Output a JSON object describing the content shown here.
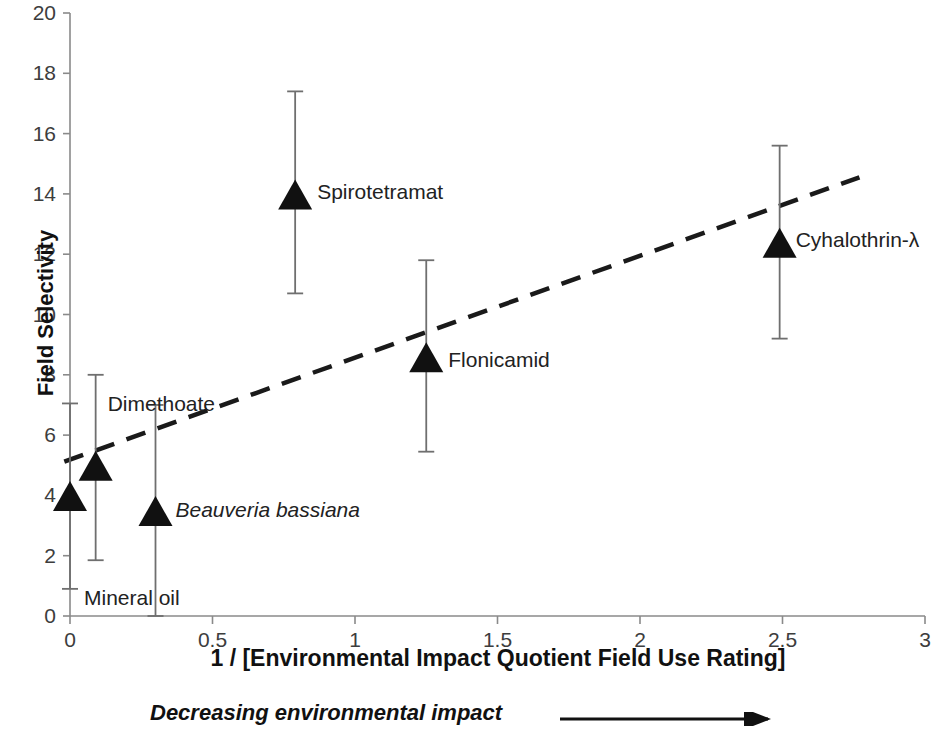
{
  "chart_data": {
    "type": "scatter",
    "title": "",
    "xlabel": "1 / [Environmental Impact Quotient Field Use Rating]",
    "ylabel": "Field Selectivity",
    "xlim": [
      0,
      3
    ],
    "ylim": [
      0,
      20
    ],
    "xticks": [
      "0",
      "0.5",
      "1",
      "1.5",
      "2",
      "2.5",
      "3"
    ],
    "xtick_values": [
      0,
      0.5,
      1,
      1.5,
      2,
      2.5,
      3
    ],
    "yticks": [
      "0",
      "2",
      "4",
      "6",
      "8",
      "10",
      "12",
      "14",
      "16",
      "18",
      "20"
    ],
    "ytick_values": [
      0,
      2,
      4,
      6,
      8,
      10,
      12,
      14,
      16,
      18,
      20
    ],
    "grid": false,
    "legend": "none",
    "marker": "filled-triangle",
    "error_bars": "vertical",
    "points": [
      {
        "label": "Mineral oil",
        "x": 0.0,
        "y": 4.0,
        "y_low": 0.9,
        "y_high": 7.05,
        "italic": false,
        "label_dx": 14,
        "label_dy": 103
      },
      {
        "label": "Dimethoate",
        "x": 0.09,
        "y": 5.0,
        "y_low": 1.85,
        "y_high": 8.0,
        "italic": false,
        "label_dx": 12,
        "label_dy": -61
      },
      {
        "label": "Beauveria bassiana",
        "x": 0.3,
        "y": 3.5,
        "y_low": 0.0,
        "y_high": 7.0,
        "italic": true,
        "label_dx": 20,
        "label_dy": 0
      },
      {
        "label": "Spirotetramat",
        "x": 0.79,
        "y": 14.0,
        "y_low": 10.7,
        "y_high": 17.4,
        "italic": false,
        "label_dx": 22,
        "label_dy": -2
      },
      {
        "label": "Flonicamid",
        "x": 1.25,
        "y": 8.6,
        "y_low": 5.45,
        "y_high": 11.8,
        "italic": false,
        "label_dx": 22,
        "label_dy": 3
      },
      {
        "label": "Cyhalothrin-λ",
        "x": 2.49,
        "y": 12.4,
        "y_low": 9.2,
        "y_high": 15.6,
        "italic": false,
        "label_dx": 16,
        "label_dy": -2
      }
    ],
    "trendline": {
      "style": "dashed",
      "x_start": -0.02,
      "y_start": 5.12,
      "x_end": 2.77,
      "y_end": 14.55
    },
    "annotation": {
      "text": "Decreasing environmental impact",
      "arrow": "right-arrow"
    },
    "colors": {
      "marker": "#111111",
      "error_bar": "#6f6f6f",
      "axis": "#8a8a8a",
      "trendline": "#1a1a1a",
      "text": "#222222",
      "background": "#ffffff"
    }
  }
}
